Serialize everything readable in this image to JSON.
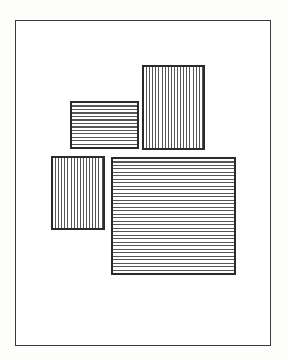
{
  "diagram": {
    "colors": {
      "background": "#ffffff",
      "stroke": "#2a2a2a",
      "hatch": "#555555"
    },
    "frame": {
      "x": 15,
      "y": 20,
      "width": 256,
      "height": 326
    },
    "rectangles": [
      {
        "id": "small-horizontal",
        "hatch": "horizontal",
        "x": 70,
        "y": 101,
        "width": 69,
        "height": 48,
        "line_count": 12
      },
      {
        "id": "tall-vertical",
        "hatch": "vertical",
        "x": 142,
        "y": 65,
        "width": 63,
        "height": 85,
        "line_count": 19
      },
      {
        "id": "small-vertical",
        "hatch": "vertical",
        "x": 51,
        "y": 156,
        "width": 54,
        "height": 74,
        "line_count": 14
      },
      {
        "id": "large-horizontal",
        "hatch": "horizontal",
        "x": 111,
        "y": 157,
        "width": 125,
        "height": 118,
        "line_count": 33
      }
    ]
  }
}
